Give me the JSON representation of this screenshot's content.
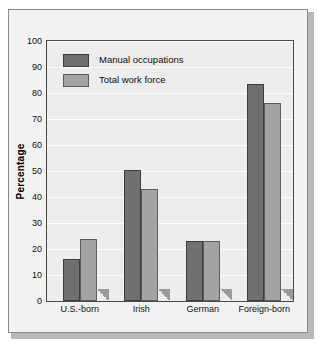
{
  "chart_data": {
    "type": "bar",
    "title": "",
    "subtitle": "",
    "xlabel": "",
    "ylabel": "Percentage",
    "ylim": [
      0,
      100
    ],
    "ytick_step": 10,
    "yticks": [
      0,
      10,
      20,
      30,
      40,
      50,
      60,
      70,
      80,
      90,
      100
    ],
    "ytick_labels": [
      "0",
      "10",
      "20",
      "30",
      "40",
      "50",
      "60",
      "70",
      "80",
      "90",
      "100"
    ],
    "grid": "horizontal",
    "legend_position": "top-left-inside",
    "categories": [
      "U.S.-born",
      "Irish",
      "German",
      "Foreign-born"
    ],
    "series": [
      {
        "name": "Manual occupations",
        "color": "#6e6e6e",
        "values": [
          16,
          50.5,
          23,
          83.5
        ]
      },
      {
        "name": "Total work force",
        "color": "#a3a3a3",
        "values": [
          24,
          43,
          23,
          76
        ]
      }
    ],
    "annotations": []
  },
  "legend": {
    "items": [
      {
        "label": "Manual occupations",
        "swatch": "manual-swatch"
      },
      {
        "label": "Total work force",
        "swatch": "total-swatch"
      }
    ]
  },
  "axes": {
    "y_title": "Percentage"
  },
  "colors": {
    "manual_bar": "#6e6e6e",
    "total_bar": "#a3a3a3",
    "plot_background": "#ededec",
    "gridline": "#fdfdfd",
    "frame_border": "#8a8a8a",
    "axis_line": "#4a4a4a",
    "figure_background": "#f2f2f1"
  }
}
